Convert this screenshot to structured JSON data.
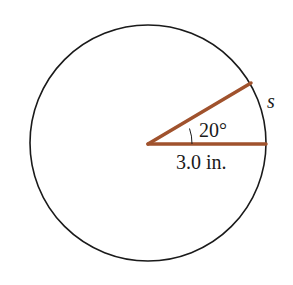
{
  "diagram": {
    "type": "circle-sector",
    "angle_label": "20°",
    "radius_label": "3.0 in.",
    "arc_label": "s",
    "colors": {
      "circle": "#1a1a1a",
      "radius_lines": "#a0522d",
      "background": "#ffffff"
    }
  }
}
